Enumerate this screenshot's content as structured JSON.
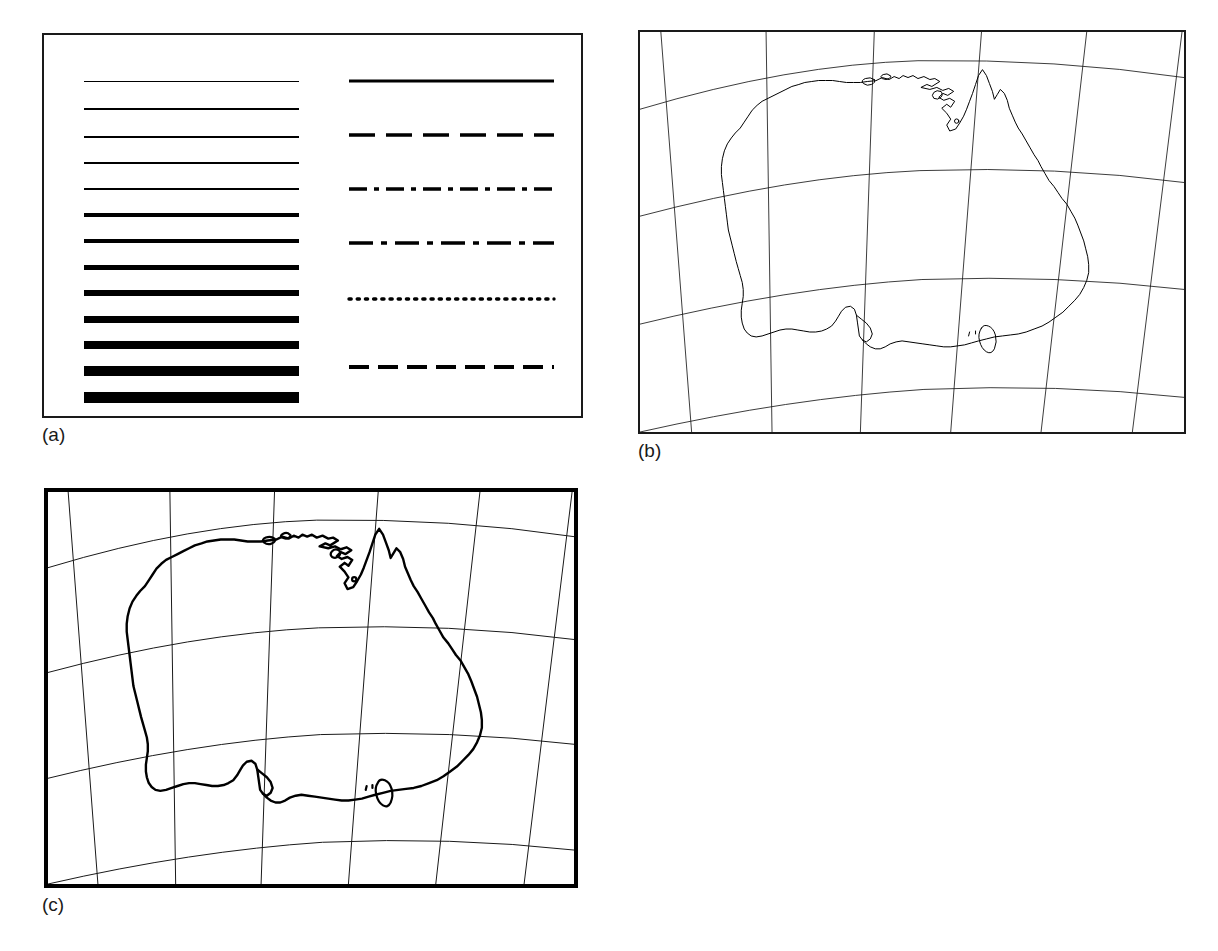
{
  "figure": {
    "background": "#ffffff",
    "ink_color": "#000000",
    "width": 1218,
    "height": 951
  },
  "panels": [
    {
      "id": "a",
      "caption": "(a)",
      "name": "line-weight-and-style-specimen-panel",
      "border_width_px": 2,
      "description": "Specimen sheet of graded line weights (left column) and line styles (right column)"
    },
    {
      "id": "b",
      "caption": "(b)",
      "name": "australia-map-thin-lines-panel",
      "border_width_px": 2,
      "description": "Outline map of Australia with graticule drawn in thin uniform line weight"
    },
    {
      "id": "c",
      "caption": "(c)",
      "name": "australia-map-thick-lines-panel",
      "border_width_px": 4,
      "description": "Same outline map of Australia with heavier coastline and heavier neat line"
    }
  ],
  "chart_data": {
    "type": "table",
    "panel_a": {
      "line_weights": {
        "label": "Graded line weights",
        "count": 13,
        "unit": "px",
        "y_positions": [
          24,
          52,
          80,
          106,
          132,
          158,
          184,
          210,
          236,
          262,
          288,
          314,
          340
        ],
        "values": [
          1.0,
          1.2,
          1.6,
          2.2,
          2.8,
          3.5,
          4.2,
          5.0,
          6.0,
          7.0,
          8.2,
          9.5,
          11.0
        ]
      },
      "line_styles": {
        "label": "Line style variants",
        "count": 6,
        "y_positions": [
          24,
          78,
          132,
          186,
          242,
          310
        ],
        "entries": [
          {
            "name": "solid",
            "dasharray": "",
            "weight": 3.2
          },
          {
            "name": "long-dash",
            "dasharray": "26 11",
            "weight": 3.6
          },
          {
            "name": "dash-dot",
            "dasharray": "18 7 5 7",
            "weight": 3.6
          },
          {
            "name": "long-dash-dot",
            "dasharray": "24 8 6 8",
            "weight": 3.4
          },
          {
            "name": "dotted",
            "dasharray": "2.2 6",
            "weight": 3.4
          },
          {
            "name": "medium-dash",
            "dasharray": "20 9",
            "weight": 3.8
          }
        ]
      }
    },
    "panel_b": {
      "subject": "Australia",
      "coastline_weight_px": 1.0,
      "graticule_weight_px": 0.85,
      "neatline_weight_px": 2,
      "graticule": {
        "meridians": 6,
        "parallels": 4,
        "projection": "conic"
      }
    },
    "panel_c": {
      "subject": "Australia",
      "coastline_weight_px": 2.4,
      "graticule_weight_px": 1.0,
      "neatline_weight_px": 4,
      "graticule": {
        "meridians": 6,
        "parallels": 4,
        "projection": "conic"
      }
    }
  }
}
